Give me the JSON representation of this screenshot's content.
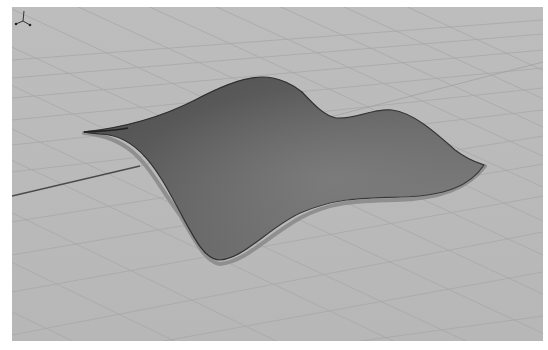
{
  "viewport": {
    "name": "Perspective",
    "background_color": "#b9b9b9",
    "grid_color": "#a6a6a6",
    "axis_line_color": "#4a4a4a",
    "surface": {
      "type": "nurbs-surface",
      "fill_dark": "#4e4e4e",
      "fill_mid": "#6b6b6b",
      "fill_light": "#858585",
      "edge_color": "#2e2e2e",
      "rim_color": "#8e8e8e"
    },
    "axis_widget": {
      "icon": "xyz-axes-icon"
    }
  }
}
